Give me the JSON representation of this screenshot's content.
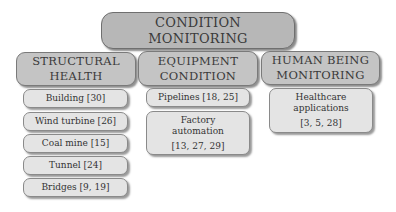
{
  "root": {
    "line1": "CONDITION",
    "line2": "MONITORING"
  },
  "categories": [
    {
      "line1": "STRUCTURAL",
      "line2": "HEALTH",
      "items": [
        {
          "label": "Building [30]"
        },
        {
          "label": "Wind turbine [26]"
        },
        {
          "label": "Coal mine [15]"
        },
        {
          "label": "Tunnel [24]"
        },
        {
          "label": "Bridges [9, 19]"
        }
      ]
    },
    {
      "line1": "EQUIPMENT",
      "line2": "CONDITION",
      "items": [
        {
          "label": "Pipelines [18, 25]"
        },
        {
          "line1": "Factory",
          "line2": "automation",
          "refs": "[13, 27, 29]"
        }
      ]
    },
    {
      "line1": "HUMAN BEING",
      "line2": "MONITORING",
      "items": [
        {
          "line1": "Healthcare",
          "line2": "applications",
          "refs": "[3, 5, 28]"
        }
      ]
    }
  ],
  "colors": {
    "root_fill": "#b7b7b7",
    "category_fill": "#c4c4c4",
    "leaf_fill": "#e4e4e4"
  }
}
